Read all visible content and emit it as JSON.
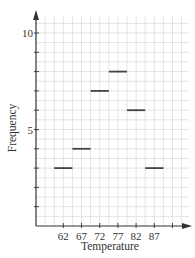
{
  "chart_data": {
    "type": "bar",
    "style": "horizontal-segment frequency plot",
    "title": "",
    "xlabel": "Temperature",
    "ylabel": "Frequency",
    "categories": [
      "62",
      "67",
      "72",
      "77",
      "82",
      "87"
    ],
    "values": [
      3,
      4,
      7,
      8,
      6,
      3
    ],
    "ylim": [
      0,
      10.8
    ],
    "yticks_labeled": [
      "5",
      "10"
    ],
    "xtick_labels": [
      "62",
      "67",
      "72",
      "77",
      "82",
      "87"
    ],
    "grid": true,
    "legend": null
  },
  "colors": {
    "grid": "#dcdcdc",
    "axis": "#333333",
    "segment": "#444444"
  }
}
